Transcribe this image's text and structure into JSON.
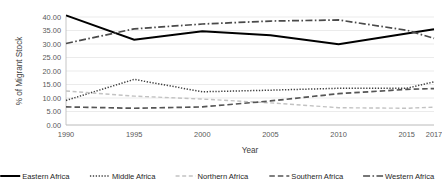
{
  "chart_data": {
    "type": "line",
    "title": "",
    "xlabel": "Year",
    "ylabel": "% of Migrant Stock",
    "categories": [
      "1990",
      "1995",
      "2000",
      "2005",
      "2010",
      "2015",
      "2017"
    ],
    "x": [
      1990,
      1995,
      2000,
      2005,
      2010,
      2015,
      2017
    ],
    "xlim": [
      1990,
      2017
    ],
    "ylim": [
      0,
      40
    ],
    "yticks": [
      "0.00",
      "5.00",
      "10.00",
      "15.00",
      "20.00",
      "25.00",
      "30.00",
      "35.00",
      "40.00"
    ],
    "ytick_values": [
      0,
      5,
      10,
      15,
      20,
      25,
      30,
      35,
      40
    ],
    "grid": "horizontal",
    "legend_position": "bottom",
    "series": [
      {
        "name": "Eastern Africa",
        "style": "solid",
        "color": "#000000",
        "width": 2.0,
        "dash": "",
        "values": [
          40.6,
          31.6,
          34.7,
          33.2,
          29.9,
          33.9,
          35.5
        ]
      },
      {
        "name": "Middle Africa",
        "style": "dotted",
        "color": "#3f3f3f",
        "width": 1.5,
        "dash": "1.3,1.6",
        "values": [
          9.1,
          16.9,
          12.3,
          12.9,
          13.6,
          13.6,
          16.0
        ]
      },
      {
        "name": "Northern Africa",
        "style": "dashed-light",
        "color": "#c2c2c2",
        "width": 1.4,
        "dash": "4,2.6",
        "values": [
          12.6,
          10.7,
          9.6,
          8.2,
          6.4,
          6.2,
          6.6
        ]
      },
      {
        "name": "Southern Africa",
        "style": "dashed",
        "color": "#555555",
        "width": 1.7,
        "dash": "5.5,3",
        "values": [
          6.7,
          6.2,
          6.7,
          8.9,
          11.6,
          13.2,
          13.5
        ]
      },
      {
        "name": "Western Africa",
        "style": "dash-dot",
        "color": "#4a4a4a",
        "width": 1.7,
        "dash": "7,2.4,1.6,2.4",
        "values": [
          30.2,
          35.6,
          37.4,
          38.5,
          38.9,
          35.1,
          32.1
        ]
      }
    ]
  },
  "legend": {
    "items": [
      {
        "label": "Eastern Africa"
      },
      {
        "label": "Middle Africa"
      },
      {
        "label": "Northern Africa"
      },
      {
        "label": "Southern Africa"
      },
      {
        "label": "Western Africa"
      }
    ]
  }
}
